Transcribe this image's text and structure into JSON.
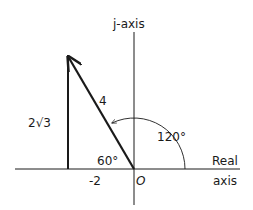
{
  "diagram": {
    "axes": {
      "vertical_label": "j-axis",
      "horizontal_label_line1": "Real",
      "horizontal_label_line2": "axis",
      "origin_label": "O"
    },
    "vector": {
      "magnitude_label": "4",
      "real_part": -2,
      "imag_part_label": "2√3",
      "angle_from_real_label": "120°",
      "interior_angle_label": "60°",
      "real_tick_label": "-2"
    },
    "colors": {
      "ink": "#1a1a1a"
    }
  }
}
